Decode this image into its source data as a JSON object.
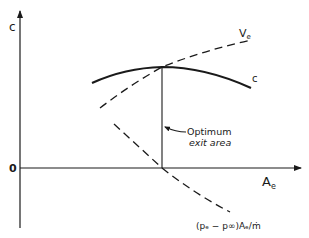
{
  "diagram": {
    "axes": {
      "y_label": "c",
      "x_label_main": "A",
      "x_label_sub": "e",
      "origin_label": "0"
    },
    "curves": {
      "c_curve_label": "c",
      "ve_curve_label_main": "V",
      "ve_curve_label_sub": "e",
      "pressure_term_label": "(pₑ − p∞)Aₑ/ṁ"
    },
    "annotation": {
      "line1": "Optimum",
      "line2": "exit area"
    },
    "colors": {
      "ink": "#1a1a1a",
      "background": "#ffffff"
    }
  }
}
